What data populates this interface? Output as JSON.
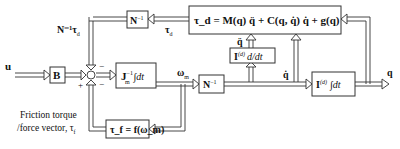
{
  "diagram": {
    "blocks": {
      "b": "B",
      "jm": "J",
      "jm_sup": "−1",
      "jm_sub": "m",
      "jm_int": "∫dt",
      "ninv_top": "N",
      "ninv_top_sup": "−1",
      "ninv_mid": "N",
      "ninv_mid_sup": "−1",
      "deriv": "I",
      "deriv_sup": "(d)",
      "deriv_op": "d/dt",
      "integ": "I",
      "integ_sup": "(d)",
      "integ_op": "∫dt",
      "dynamics": "τ_d = M(q) q̈ + C(q, q̇) q̇ + g(q)",
      "friction": "τ_f = f(ω_m)"
    },
    "signals": {
      "input": "u",
      "ntau": "N⁻¹τ",
      "ntau_sub": "d",
      "tau_d": "τ",
      "tau_d_sub": "d",
      "omega": "ω",
      "omega_sub": "m",
      "qddot": "q̈",
      "qdot": "q̇",
      "q": "q"
    },
    "junction": {
      "plus": "+",
      "minus_top": "−",
      "minus_bottom": "−"
    },
    "labels": {
      "friction_line1": "Friction torque",
      "friction_line2": "/force vector, τ",
      "friction_sub": "f"
    }
  }
}
